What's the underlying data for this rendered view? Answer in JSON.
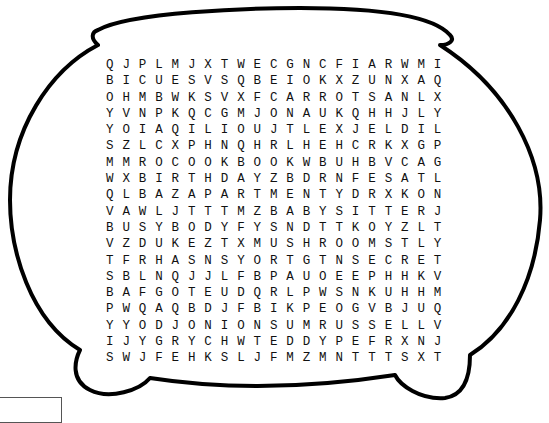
{
  "puzzle": {
    "title": "",
    "rows": [
      "QJPLMJXTWECGNCFIARWMI",
      "BICUESVSQBEIOKXZUNXAQ",
      "OHMBWKSVXFCARROTSANLX",
      "YVNPKQCGMJONAUKQHHJLY",
      "YOIAQILIOUJTLEXJELDIL",
      "SZLCXPHNQHRLHEHCRKXGP",
      "MMROCOOKBOOKWBUHBVCAG",
      "WXBIRTHDAYZBDRNFESATL",
      "QLBAZAPARTMENTYDRXKON",
      "VAWLJTTTMZBABYSITTERJ",
      "BUSYBODYFYSNDTTKOYZLT",
      "VZDUKEZTXMUSHROOMSTLY",
      "TFRHASNSYORTGTNSECRET",
      "SBLNQJJLFBPAUOEEPHHKV",
      "BAFGOTEUDQRLPWSNKUHHM",
      "PWQAQBDJFBIKPEOGVBJUQ",
      "YYODJONIONSUMRUSSELLV",
      "IJYGRYCHWTEDDYPEFRXNJ",
      "SWJFEHKSLJFMZMNTTTSXT"
    ]
  },
  "frame": {
    "shape": "cooking-pot-outline",
    "stroke_color": "#000000"
  },
  "corner_box": {
    "text": ""
  }
}
